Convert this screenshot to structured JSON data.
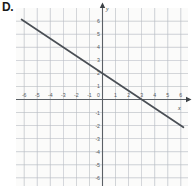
{
  "figure": {
    "panel_label": "D.",
    "background_color": "#fbfbfa",
    "grid_color": "#b9bdc4",
    "minor_grid_color": "#dcdfe3",
    "axis_color": "#5b6065",
    "line_color": "#4a4f55"
  },
  "chart_data": {
    "type": "line",
    "title": "",
    "xlabel": "x",
    "ylabel": "y",
    "xlim": [
      -6.6,
      6.6
    ],
    "ylim": [
      -6.6,
      6.6
    ],
    "grid": true,
    "legend": "none",
    "x_ticks": [
      -6,
      -5,
      -4,
      -3,
      -2,
      -1,
      0,
      1,
      2,
      3,
      4,
      5,
      6
    ],
    "x_tick_labels": [
      "-6",
      "-5",
      "-4",
      "-3",
      "-2",
      "-1",
      "0",
      "1",
      "2",
      "3",
      "4",
      "5",
      "6"
    ],
    "y_ticks": [
      6,
      5,
      4,
      3,
      2,
      1,
      -1,
      -2,
      -3,
      -4,
      -5,
      -6
    ],
    "y_tick_labels": [
      "6",
      "5",
      "4",
      "3",
      "2",
      "1",
      "-1",
      "-2",
      "-3",
      "-4",
      "-5",
      "-6"
    ],
    "series": [
      {
        "name": "line-d",
        "type": "line",
        "slope": -0.6667,
        "intercept": 2,
        "equation": "y = -2/3 x + 2",
        "x_intercept": 3,
        "y_intercept": 2,
        "x": [
          -6.2,
          6.2
        ],
        "values": [
          6.13,
          -2.13
        ],
        "color": "#4a4f55"
      }
    ]
  },
  "axes": {
    "x_axis_arrow": true,
    "y_axis_arrow": true,
    "x_label": "x",
    "y_label": "y"
  }
}
